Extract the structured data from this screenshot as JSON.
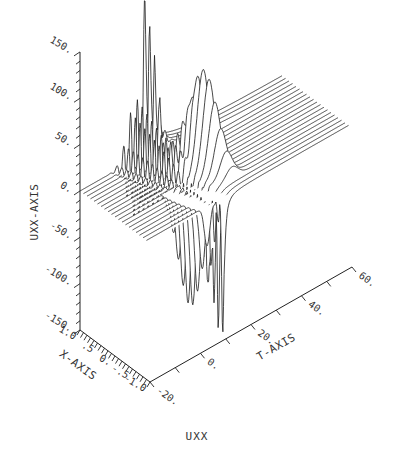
{
  "caption": "UXX",
  "chart_data": {
    "type": "surface-wireframe",
    "title": "UXX",
    "xlabel": "X-AXIS",
    "tlabel": "T-AXIS",
    "zlabel": "UXX-AXIS",
    "x_range": [
      1.0,
      -1.0
    ],
    "t_range": [
      -20,
      60
    ],
    "z_range": [
      -150,
      150
    ],
    "x_ticks": [
      "1.0",
      ".5",
      "0.",
      "-.5",
      "-1.0"
    ],
    "t_ticks": [
      "-20.",
      "0.",
      "20.",
      "40.",
      "60."
    ],
    "z_ticks": [
      "150.",
      "100.",
      "50.",
      "0.",
      "-50.",
      "-100.",
      "-150."
    ],
    "num_traces": 20,
    "features": [
      {
        "name": "sharp positive spike",
        "trace_range": [
          0,
          3
        ],
        "t_center": 6,
        "amplitude": 130
      },
      {
        "name": "oscillatory packet",
        "trace_range": [
          0,
          9
        ],
        "t_center": 3,
        "amplitude": 70
      },
      {
        "name": "positive hump",
        "trace_range": [
          8,
          15
        ],
        "t_center": 14,
        "amplitude": 110
      },
      {
        "name": "negative spikes",
        "trace_range": [
          12,
          19
        ],
        "t_center": 6,
        "amplitude": -120
      },
      {
        "name": "sharp negative spike",
        "trace_range": [
          17,
          19
        ],
        "t_center": 10,
        "amplitude": -130
      }
    ]
  },
  "geometry": {
    "origin": [
      80,
      191
    ],
    "trace_step": [
      3.5,
      2.6
    ],
    "t_step_per_unit": [
      2.525,
      -1.4375
    ],
    "z_px_per_unit": 0.927
  }
}
